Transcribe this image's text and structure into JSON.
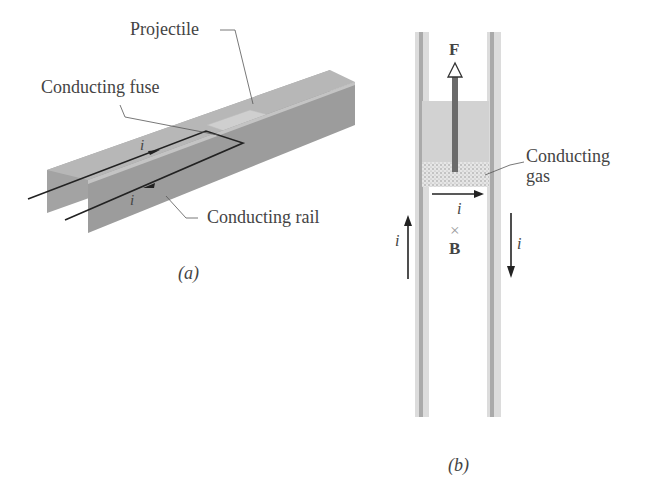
{
  "panel_a": {
    "labels": {
      "projectile": "Projectile",
      "fuse": "Conducting fuse",
      "rail": "Conducting rail",
      "current_top": "i",
      "current_bottom": "i"
    },
    "caption": "(a)"
  },
  "panel_b": {
    "labels": {
      "force": "F",
      "gas_line1": "Conducting",
      "gas_line2": "gas",
      "current_across": "i",
      "current_left": "i",
      "current_right": "i",
      "field_symbol": "×",
      "field": "B"
    },
    "caption": "(b)"
  },
  "colors": {
    "rail": "#9a9a9a",
    "rail_dark": "#8a8a8a",
    "projectile": "#c8c8c8",
    "text": "#444444",
    "wire": "#222222"
  }
}
